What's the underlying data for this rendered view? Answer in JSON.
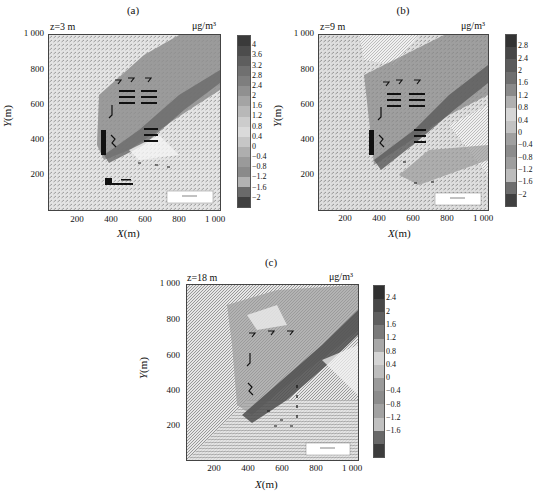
{
  "figure": {
    "unit_label": "μg/m³",
    "x_axis_label": "X(m)",
    "y_axis_label": "Y(m)",
    "x_ticks": [
      "200",
      "400",
      "600",
      "800",
      "1 000"
    ],
    "y_ticks": [
      "1 000",
      "800",
      "600",
      "400",
      "200"
    ],
    "reference_vector_label": "Reference Vector"
  },
  "panels": [
    {
      "id": "a",
      "title": "(a)",
      "height_label": "z=3 m",
      "colorbar_ticks": [
        "4",
        "3.6",
        "3.2",
        "2.8",
        "2.4",
        "2",
        "1.6",
        "1.2",
        "0.8",
        "0.4",
        "0",
        "-0.4",
        "-0.8",
        "-1.2",
        "-1.6",
        "-2"
      ]
    },
    {
      "id": "b",
      "title": "(b)",
      "height_label": "z=9 m",
      "colorbar_ticks": [
        "2.8",
        "2.4",
        "2",
        "1.6",
        "1.2",
        "0.8",
        "0.4",
        "0",
        "-0.4",
        "-0.8",
        "-1.2",
        "-1.6",
        "-2"
      ]
    },
    {
      "id": "c",
      "title": "(c)",
      "height_label": "z=18 m",
      "colorbar_ticks": [
        "2.4",
        "2",
        "1.6",
        "1.2",
        "0.8",
        "0.4",
        "0",
        "-0.4",
        "-0.8",
        "-1.2",
        "-1.6"
      ]
    }
  ],
  "chart_data": [
    {
      "type": "heatmap",
      "title": "(a) z=3 m",
      "xlabel": "X(m)",
      "ylabel": "Y(m)",
      "xlim": [
        0,
        1000
      ],
      "ylim": [
        0,
        1000
      ],
      "colorbar_label": "μg/m³",
      "colorbar_range": [
        -2.2,
        4.2
      ],
      "colorbar_ticks": [
        4,
        3.6,
        3.2,
        2.8,
        2.4,
        2,
        1.6,
        1.2,
        0.8,
        0.4,
        0,
        -0.4,
        -0.8,
        -1.2,
        -1.6,
        -2
      ],
      "annotations": [
        "wind vector field overlay",
        "Reference Vector box at lower right",
        "pollutant plume extending from ~(330,330) toward (1000,950)"
      ]
    },
    {
      "type": "heatmap",
      "title": "(b) z=9 m",
      "xlabel": "X(m)",
      "ylabel": "Y(m)",
      "xlim": [
        0,
        1000
      ],
      "ylim": [
        0,
        1000
      ],
      "colorbar_label": "μg/m³",
      "colorbar_range": [
        -2.2,
        3.0
      ],
      "colorbar_ticks": [
        2.8,
        2.4,
        2,
        1.6,
        1.2,
        0.8,
        0.4,
        0,
        -0.4,
        -0.8,
        -1.2,
        -1.6,
        -2
      ],
      "annotations": [
        "wind vector field overlay",
        "Reference Vector box at lower right"
      ]
    },
    {
      "type": "heatmap",
      "title": "(c) z=18 m",
      "xlabel": "X(m)",
      "ylabel": "Y(m)",
      "xlim": [
        0,
        1000
      ],
      "ylim": [
        0,
        1000
      ],
      "colorbar_label": "μg/m³",
      "colorbar_range": [
        -1.8,
        2.6
      ],
      "colorbar_ticks": [
        2.4,
        2,
        1.6,
        1.2,
        0.8,
        0.4,
        0,
        -0.4,
        -0.8,
        -1.2,
        -1.6
      ],
      "annotations": [
        "wind vector field overlay",
        "Reference Vector box at lower right"
      ]
    }
  ],
  "colors": {
    "colorbar_a": [
      "#3a3a3a",
      "#4c4c4c",
      "#5e5e5e",
      "#707070",
      "#7e7e7e",
      "#909090",
      "#a4a4a4",
      "#b8b8b8",
      "#cccccc",
      "#dadada",
      "#c6c6c6",
      "#aeaeae",
      "#9a9a9a",
      "#8a8a8a",
      "#b2b2b2",
      "#6a6a6a",
      "#404040"
    ],
    "colorbar_b": [
      "#333333",
      "#474747",
      "#5b5b5b",
      "#6f6f6f",
      "#8a8a8a",
      "#b0b0b0",
      "#d6d6d6",
      "#c2c2c2",
      "#a0a0a0",
      "#8c8c8c",
      "#9e9e9e",
      "#bcbcbc",
      "#6e6e6e",
      "#404040"
    ],
    "colorbar_c": [
      "#303030",
      "#474747",
      "#5f5f5f",
      "#7a7a7a",
      "#a8a8a8",
      "#d4d4d4",
      "#bdbdbd",
      "#9a9a9a",
      "#8c8c8c",
      "#a2a2a2",
      "#c0c0c0",
      "#686868",
      "#3c3c3c"
    ]
  }
}
